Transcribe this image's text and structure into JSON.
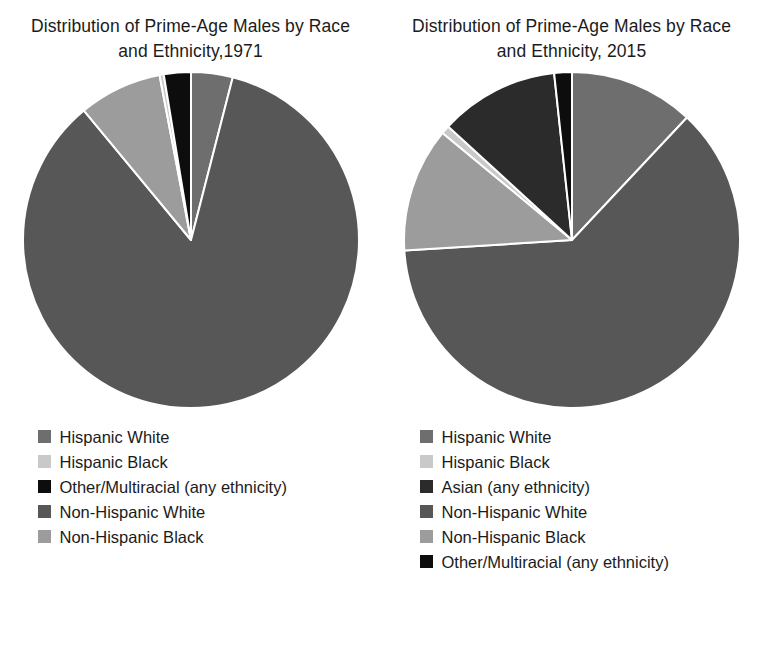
{
  "figure": {
    "background_color": "#ffffff",
    "text_color": "#1b1b1b"
  },
  "palette": {
    "hispanic_white": "#6e6e6e",
    "hispanic_black": "#c9c9c9",
    "other_multiracial": "#0d0d0d",
    "asian": "#2b2b2b",
    "non_hispanic_white": "#575757",
    "non_hispanic_black": "#9c9c9c",
    "wedge_edge": "#ffffff"
  },
  "panels": [
    {
      "id": "panel-1971",
      "title": "Distribution of Prime-Age Males by Race and Ethnicity,1971",
      "legend": [
        {
          "label": "Hispanic White",
          "color": "#6e6e6e"
        },
        {
          "label": "Hispanic Black",
          "color": "#c9c9c9"
        },
        {
          "label": "Other/Multiracial (any ethnicity)",
          "color": "#0d0d0d"
        },
        {
          "label": "Non-Hispanic White",
          "color": "#575757"
        },
        {
          "label": "Non-Hispanic Black",
          "color": "#9c9c9c"
        }
      ]
    },
    {
      "id": "panel-2015",
      "title": "Distribution of Prime-Age Males by Race and Ethnicity, 2015",
      "legend": [
        {
          "label": "Hispanic White",
          "color": "#6e6e6e"
        },
        {
          "label": "Hispanic Black",
          "color": "#c9c9c9"
        },
        {
          "label": "Asian (any ethnicity)",
          "color": "#2b2b2b"
        },
        {
          "label": "Non-Hispanic White",
          "color": "#575757"
        },
        {
          "label": "Non-Hispanic Black",
          "color": "#9c9c9c"
        },
        {
          "label": "Other/Multiracial (any ethnicity)",
          "color": "#0d0d0d"
        }
      ]
    }
  ],
  "chart_data": [
    {
      "type": "pie",
      "title": "Distribution of Prime-Age Males by Race and Ethnicity,1971",
      "xlabel": "",
      "ylabel": "",
      "legend_position": "bottom",
      "grid": false,
      "start_angle_deg": 0,
      "direction": "clockwise",
      "categories": [
        "Hispanic White",
        "Non-Hispanic White",
        "Non-Hispanic Black",
        "Hispanic Black",
        "Other/Multiracial (any ethnicity)"
      ],
      "values": [
        4.0,
        85.0,
        8.0,
        0.4,
        2.6
      ],
      "unit": "percent",
      "slices": [
        {
          "label": "Hispanic White",
          "value": 4.0,
          "color": "#6e6e6e"
        },
        {
          "label": "Non-Hispanic White",
          "value": 85.0,
          "color": "#575757"
        },
        {
          "label": "Non-Hispanic Black",
          "value": 8.0,
          "color": "#9c9c9c"
        },
        {
          "label": "Hispanic Black",
          "value": 0.4,
          "color": "#c9c9c9"
        },
        {
          "label": "Other/Multiracial (any ethnicity)",
          "value": 2.6,
          "color": "#0d0d0d"
        }
      ]
    },
    {
      "type": "pie",
      "title": "Distribution of Prime-Age Males by Race and Ethnicity, 2015",
      "xlabel": "",
      "ylabel": "",
      "legend_position": "bottom",
      "grid": false,
      "start_angle_deg": 0,
      "direction": "clockwise",
      "categories": [
        "Hispanic White",
        "Non-Hispanic White",
        "Non-Hispanic Black",
        "Hispanic Black",
        "Asian (any ethnicity)",
        "Other/Multiracial (any ethnicity)"
      ],
      "values": [
        12.0,
        62.0,
        12.0,
        0.8,
        11.5,
        1.7
      ],
      "unit": "percent",
      "slices": [
        {
          "label": "Hispanic White",
          "value": 12.0,
          "color": "#6e6e6e"
        },
        {
          "label": "Non-Hispanic White",
          "value": 62.0,
          "color": "#575757"
        },
        {
          "label": "Non-Hispanic Black",
          "value": 12.0,
          "color": "#9c9c9c"
        },
        {
          "label": "Hispanic Black",
          "value": 0.8,
          "color": "#c9c9c9"
        },
        {
          "label": "Asian (any ethnicity)",
          "value": 11.5,
          "color": "#2b2b2b"
        },
        {
          "label": "Other/Multiracial (any ethnicity)",
          "value": 1.7,
          "color": "#0d0d0d"
        }
      ]
    }
  ]
}
